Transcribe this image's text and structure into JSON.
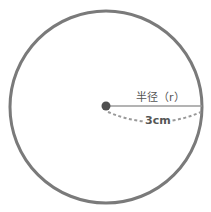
{
  "diagram": {
    "radius_label": "半径（r）",
    "length_label": "3cm",
    "colors": {
      "circle_stroke": "#7a7a7a",
      "radius_line": "#9a9a9a",
      "center_dot": "#505050",
      "dashed_arc": "#999999",
      "text": "#555555"
    }
  }
}
